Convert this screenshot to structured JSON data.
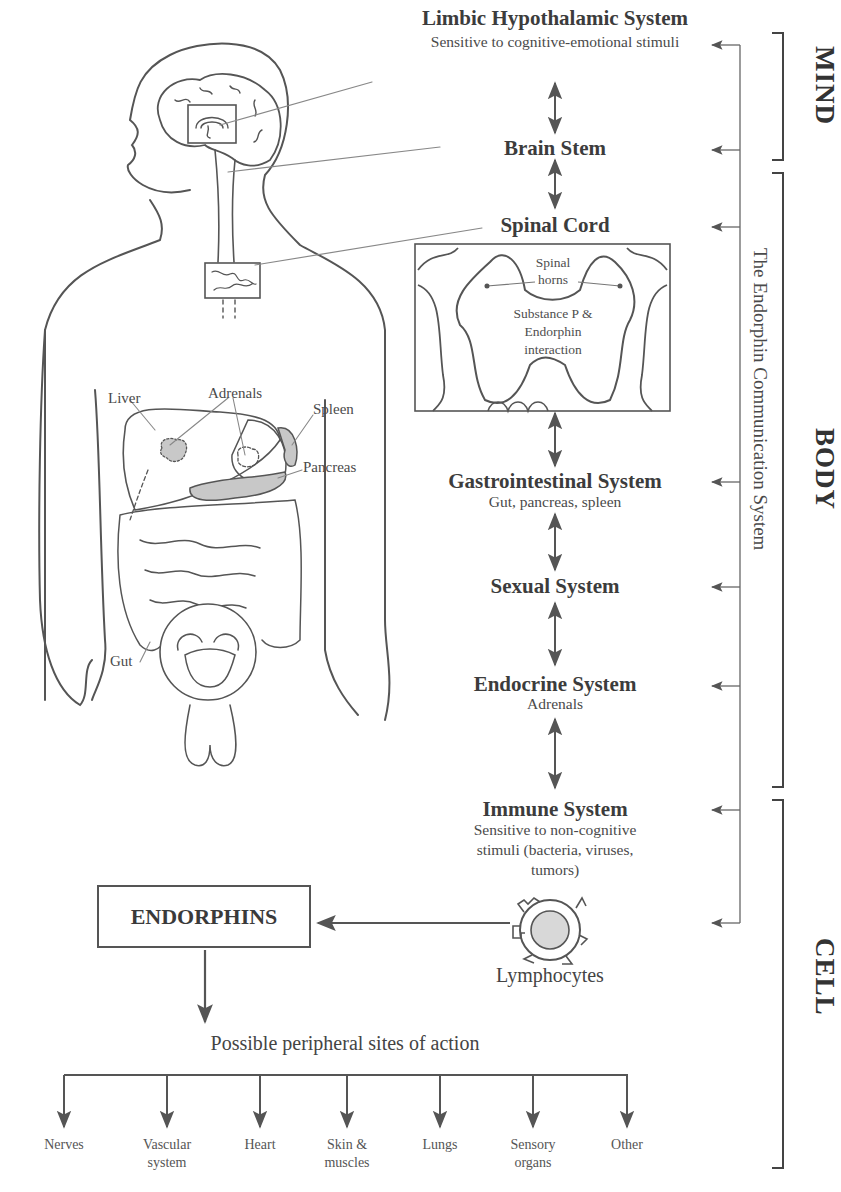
{
  "diagram": {
    "title_hidden": "The Endorphin Communication System",
    "regions": [
      {
        "label": "MIND"
      },
      {
        "label": "BODY"
      },
      {
        "label": "CELL"
      }
    ],
    "system_axis_label": "The Endorphin Communication System",
    "levels": [
      {
        "title": "Limbic Hypothalamic System",
        "subtitle": "Sensitive to cognitive-emotional stimuli"
      },
      {
        "title": "Brain Stem"
      },
      {
        "title": "Spinal Cord"
      },
      {
        "title": "Gastrointestinal System",
        "subtitle": "Gut, pancreas, spleen"
      },
      {
        "title": "Sexual System"
      },
      {
        "title": "Endocrine System",
        "subtitle": "Adrenals"
      },
      {
        "title": "Immune System",
        "subtitle_lines": [
          "Sensitive to non-cognitive",
          "stimuli (bacteria, viruses,",
          "tumors)"
        ]
      }
    ],
    "spinal_inset": {
      "horns_label_lines": [
        "Spinal",
        "horns"
      ],
      "interaction_lines": [
        "Substance P &",
        "Endorphin",
        "interaction"
      ]
    },
    "anatomy_labels": {
      "liver": "Liver",
      "adrenals": "Adrenals",
      "spleen": "Spleen",
      "pancreas": "Pancreas",
      "gut": "Gut"
    },
    "cell": {
      "lymphocyte_label": "Lymphocytes",
      "endorphins_box": "ENDORPHINS",
      "peripheral_title": "Possible peripheral sites of action",
      "peripheral_sites": [
        {
          "lines": [
            "Nerves"
          ]
        },
        {
          "lines": [
            "Vascular",
            "system"
          ]
        },
        {
          "lines": [
            "Heart"
          ]
        },
        {
          "lines": [
            "Skin &",
            "muscles"
          ]
        },
        {
          "lines": [
            "Lungs"
          ]
        },
        {
          "lines": [
            "Sensory",
            "organs"
          ]
        },
        {
          "lines": [
            "Other"
          ]
        }
      ]
    },
    "colors": {
      "ink": "#3a3a3a",
      "organ_fill": "#c8c8c8",
      "line": "#555555"
    }
  }
}
